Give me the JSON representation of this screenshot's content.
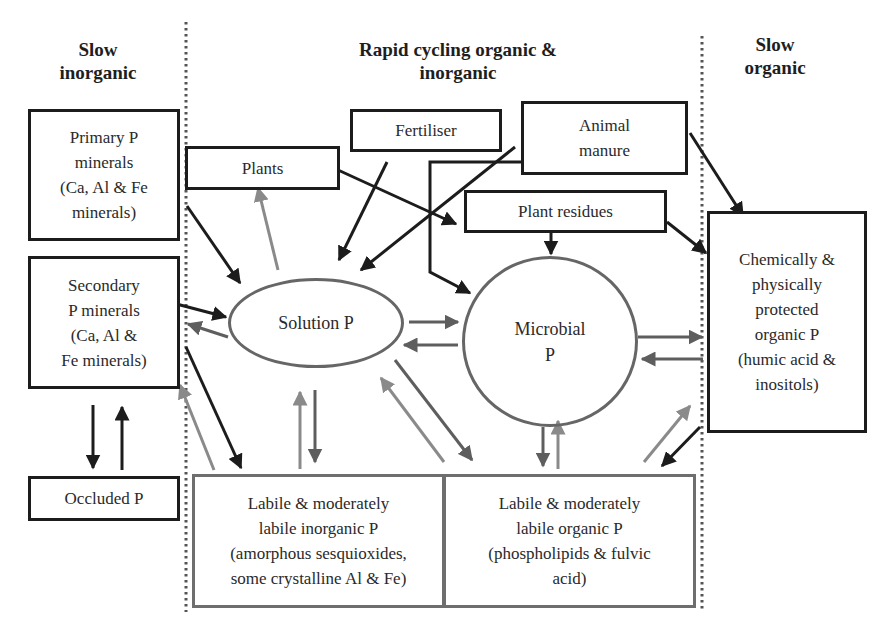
{
  "columns": {
    "left": "Slow\ninorganic",
    "center": "Rapid cycling organic &\ninorganic",
    "right": "Slow\norganic"
  },
  "nodes": {
    "primary_minerals": "Primary P\nminerals\n(Ca, Al & Fe\nminerals)",
    "secondary_minerals": "Secondary\nP minerals\n(Ca, Al &\nFe minerals)",
    "occluded": "Occluded P",
    "plants": "Plants",
    "fertiliser": "Fertiliser",
    "animal_manure": "Animal\nmanure",
    "plant_residues": "Plant residues",
    "solution_p": "Solution P",
    "microbial_p": "Microbial\nP",
    "protected_organic": "Chemically &\nphysically\nprotected\norganic P\n(humic acid &\ninositols)",
    "labile_inorganic": "Labile & moderately\nlabile inorganic P\n(amorphous sesquioxides,\nsome crystalline Al & Fe)",
    "labile_organic": "Labile & moderately\nlabile organic P\n(phospholipids & fulvic\nacid)"
  },
  "colors": {
    "dark_stroke": "#1c1c1c",
    "gray_stroke": "#6e6e6e",
    "light_arrow": "#8a8a8a",
    "divider": "#555555"
  },
  "edges": [
    {
      "from": "Primary P minerals",
      "to": "Solution P",
      "tone": "dark"
    },
    {
      "from": "Secondary P minerals",
      "to": "Solution P",
      "tone": "dark"
    },
    {
      "from": "Solution P",
      "to": "Secondary P minerals",
      "tone": "gray"
    },
    {
      "from": "Secondary P minerals",
      "to": "Labile inorganic P",
      "tone": "dark"
    },
    {
      "from": "Labile inorganic P",
      "to": "Secondary P minerals",
      "tone": "light"
    },
    {
      "from": "Secondary P minerals",
      "to": "Occluded P",
      "tone": "dark"
    },
    {
      "from": "Occluded P",
      "to": "Secondary P minerals",
      "tone": "dark"
    },
    {
      "from": "Solution P",
      "to": "Plants",
      "tone": "light"
    },
    {
      "from": "Plants",
      "to": "Plant residues",
      "tone": "dark"
    },
    {
      "from": "Fertiliser",
      "to": "Solution P",
      "tone": "dark"
    },
    {
      "from": "Animal manure",
      "to": "Solution P",
      "tone": "dark"
    },
    {
      "from": "Animal manure",
      "to": "Microbial P",
      "tone": "dark"
    },
    {
      "from": "Animal manure",
      "to": "Protected organic P",
      "tone": "dark"
    },
    {
      "from": "Plant residues",
      "to": "Microbial P",
      "tone": "dark"
    },
    {
      "from": "Plant residues",
      "to": "Protected organic P",
      "tone": "dark"
    },
    {
      "from": "Solution P",
      "to": "Microbial P",
      "tone": "gray"
    },
    {
      "from": "Microbial P",
      "to": "Solution P",
      "tone": "gray"
    },
    {
      "from": "Microbial P",
      "to": "Protected organic P",
      "tone": "gray"
    },
    {
      "from": "Protected organic P",
      "to": "Microbial P",
      "tone": "dark"
    },
    {
      "from": "Solution P",
      "to": "Labile inorganic P",
      "tone": "gray"
    },
    {
      "from": "Labile inorganic P",
      "to": "Solution P",
      "tone": "light"
    },
    {
      "from": "Solution P",
      "to": "Labile organic P",
      "tone": "gray"
    },
    {
      "from": "Labile organic P",
      "to": "Solution P",
      "tone": "light"
    },
    {
      "from": "Microbial P",
      "to": "Labile organic P",
      "tone": "gray"
    },
    {
      "from": "Labile organic P",
      "to": "Microbial P",
      "tone": "light"
    },
    {
      "from": "Labile organic P",
      "to": "Protected organic P",
      "tone": "light"
    },
    {
      "from": "Protected organic P",
      "to": "Labile organic P",
      "tone": "dark"
    }
  ]
}
